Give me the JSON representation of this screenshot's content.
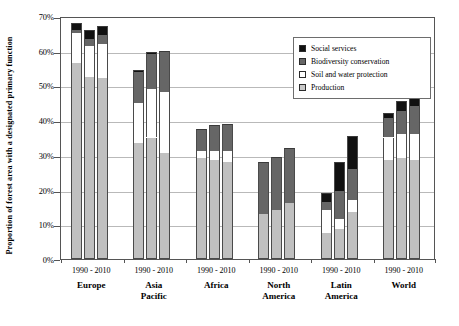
{
  "chart_data": {
    "type": "bar",
    "subtype": "stacked-grouped",
    "title": "",
    "xlabel": "",
    "ylabel": "Proportion of forest area with a designated primary function",
    "ylim": [
      0,
      70
    ],
    "yticks": [
      "0%",
      "10%",
      "20%",
      "30%",
      "40%",
      "50%",
      "60%",
      "70%"
    ],
    "ytick_values": [
      0,
      10,
      20,
      30,
      40,
      50,
      60,
      70
    ],
    "grid": true,
    "legend_position": "top-right",
    "legend": [
      {
        "label": "Social services",
        "color": "#111111",
        "key": "social_services"
      },
      {
        "label": "Biodiversity conservation",
        "color": "#666666",
        "key": "biodiversity_conservation"
      },
      {
        "label": "Soil and water protection",
        "color": "#ffffff",
        "key": "soil_and_water_protection"
      },
      {
        "label": "Production",
        "color": "#c0c0c0",
        "key": "production"
      }
    ],
    "groups": [
      {
        "name": "Europe",
        "years_label": "1990 - 2010"
      },
      {
        "name": "Asia Pacific",
        "name_lines": [
          "Asia",
          "Pacific"
        ],
        "years_label": "1990 - 2010"
      },
      {
        "name": "Africa",
        "years_label": "1990 - 2010"
      },
      {
        "name": "North America",
        "name_lines": [
          "North",
          "America"
        ],
        "years_label": "1990 - 2010"
      },
      {
        "name": "Latin America",
        "name_lines": [
          "Latin",
          "America"
        ],
        "years_label": "1990 - 2010"
      },
      {
        "name": "World",
        "years_label": "1990 - 2010"
      }
    ],
    "series_order": [
      "production",
      "soil_and_water_protection",
      "biodiversity_conservation",
      "social_services"
    ],
    "bars": [
      {
        "group": "Europe",
        "year": "1990",
        "production": 56.5,
        "soil_and_water_protection": 8.5,
        "biodiversity_conservation": 1.0,
        "social_services": 2.0,
        "total": 68.0
      },
      {
        "group": "Europe",
        "year": "2000",
        "production": 52.5,
        "soil_and_water_protection": 9.0,
        "biodiversity_conservation": 2.0,
        "social_services": 2.5,
        "total": 66.0
      },
      {
        "group": "Europe",
        "year": "2010",
        "production": 52.0,
        "soil_and_water_protection": 10.0,
        "biodiversity_conservation": 2.5,
        "social_services": 2.5,
        "total": 67.0
      },
      {
        "group": "Asia Pacific",
        "year": "1990",
        "production": 33.5,
        "soil_and_water_protection": 11.5,
        "biodiversity_conservation": 9.0,
        "social_services": 0.5,
        "total": 54.5
      },
      {
        "group": "Asia Pacific",
        "year": "2000",
        "production": 35.0,
        "soil_and_water_protection": 14.0,
        "biodiversity_conservation": 10.0,
        "social_services": 0.5,
        "total": 59.5
      },
      {
        "group": "Asia Pacific",
        "year": "2010",
        "production": 30.5,
        "soil_and_water_protection": 17.5,
        "biodiversity_conservation": 11.5,
        "social_services": 0.5,
        "total": 60.0
      },
      {
        "group": "Africa",
        "year": "1990",
        "production": 29.0,
        "soil_and_water_protection": 2.0,
        "biodiversity_conservation": 6.5,
        "social_services": 0.0,
        "total": 37.5
      },
      {
        "group": "Africa",
        "year": "2000",
        "production": 28.5,
        "soil_and_water_protection": 2.5,
        "biodiversity_conservation": 7.5,
        "social_services": 0.0,
        "total": 38.5
      },
      {
        "group": "Africa",
        "year": "2010",
        "production": 28.0,
        "soil_and_water_protection": 3.0,
        "biodiversity_conservation": 8.0,
        "social_services": 0.0,
        "total": 39.0
      },
      {
        "group": "North America",
        "year": "1990",
        "production": 13.0,
        "soil_and_water_protection": 0.0,
        "biodiversity_conservation": 15.0,
        "social_services": 0.0,
        "total": 28.0
      },
      {
        "group": "North America",
        "year": "2000",
        "production": 14.0,
        "soil_and_water_protection": 0.0,
        "biodiversity_conservation": 15.5,
        "social_services": 0.0,
        "total": 29.5
      },
      {
        "group": "North America",
        "year": "2010",
        "production": 16.0,
        "soil_and_water_protection": 0.0,
        "biodiversity_conservation": 16.0,
        "social_services": 0.0,
        "total": 32.0
      },
      {
        "group": "Latin America",
        "year": "1990",
        "production": 7.5,
        "soil_and_water_protection": 6.5,
        "biodiversity_conservation": 2.5,
        "social_services": 2.5,
        "total": 19.0
      },
      {
        "group": "Latin America",
        "year": "2000",
        "production": 8.5,
        "soil_and_water_protection": 3.0,
        "biodiversity_conservation": 8.0,
        "social_services": 8.5,
        "total": 28.0
      },
      {
        "group": "Latin America",
        "year": "2010",
        "production": 13.5,
        "soil_and_water_protection": 3.5,
        "biodiversity_conservation": 9.0,
        "social_services": 9.5,
        "total": 35.5
      },
      {
        "group": "World",
        "year": "1990",
        "production": 28.5,
        "soil_and_water_protection": 6.5,
        "biodiversity_conservation": 5.5,
        "social_services": 1.5,
        "total": 42.0
      },
      {
        "group": "World",
        "year": "2000",
        "production": 29.0,
        "soil_and_water_protection": 7.0,
        "biodiversity_conservation": 6.5,
        "social_services": 3.0,
        "total": 45.5
      },
      {
        "group": "World",
        "year": "2010",
        "production": 28.5,
        "soil_and_water_protection": 7.5,
        "biodiversity_conservation": 8.0,
        "social_services": 4.0,
        "total": 48.0
      }
    ]
  }
}
